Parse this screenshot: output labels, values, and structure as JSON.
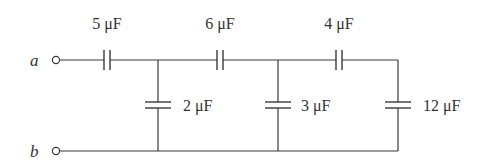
{
  "diagram": {
    "type": "capacitor ladder network",
    "terminals": [
      {
        "id": "a",
        "label": "a"
      },
      {
        "id": "b",
        "label": "b"
      }
    ],
    "capacitors": [
      {
        "id": "c1",
        "label": "5 μF",
        "value_uF": 5,
        "orientation": "series",
        "position": "top wire, first"
      },
      {
        "id": "c2",
        "label": "2 μF",
        "value_uF": 2,
        "orientation": "shunt",
        "position": "first rung"
      },
      {
        "id": "c3",
        "label": "6 μF",
        "value_uF": 6,
        "orientation": "series",
        "position": "top wire, second"
      },
      {
        "id": "c4",
        "label": "3 μF",
        "value_uF": 3,
        "orientation": "shunt",
        "position": "second rung"
      },
      {
        "id": "c5",
        "label": "4 μF",
        "value_uF": 4,
        "orientation": "series",
        "position": "top wire, third"
      },
      {
        "id": "c6",
        "label": "12 μF",
        "value_uF": 12,
        "orientation": "shunt",
        "position": "last rung"
      }
    ],
    "colors": {
      "line": "#3a3a3a",
      "text": "#333333",
      "background": "#ffffff"
    }
  }
}
